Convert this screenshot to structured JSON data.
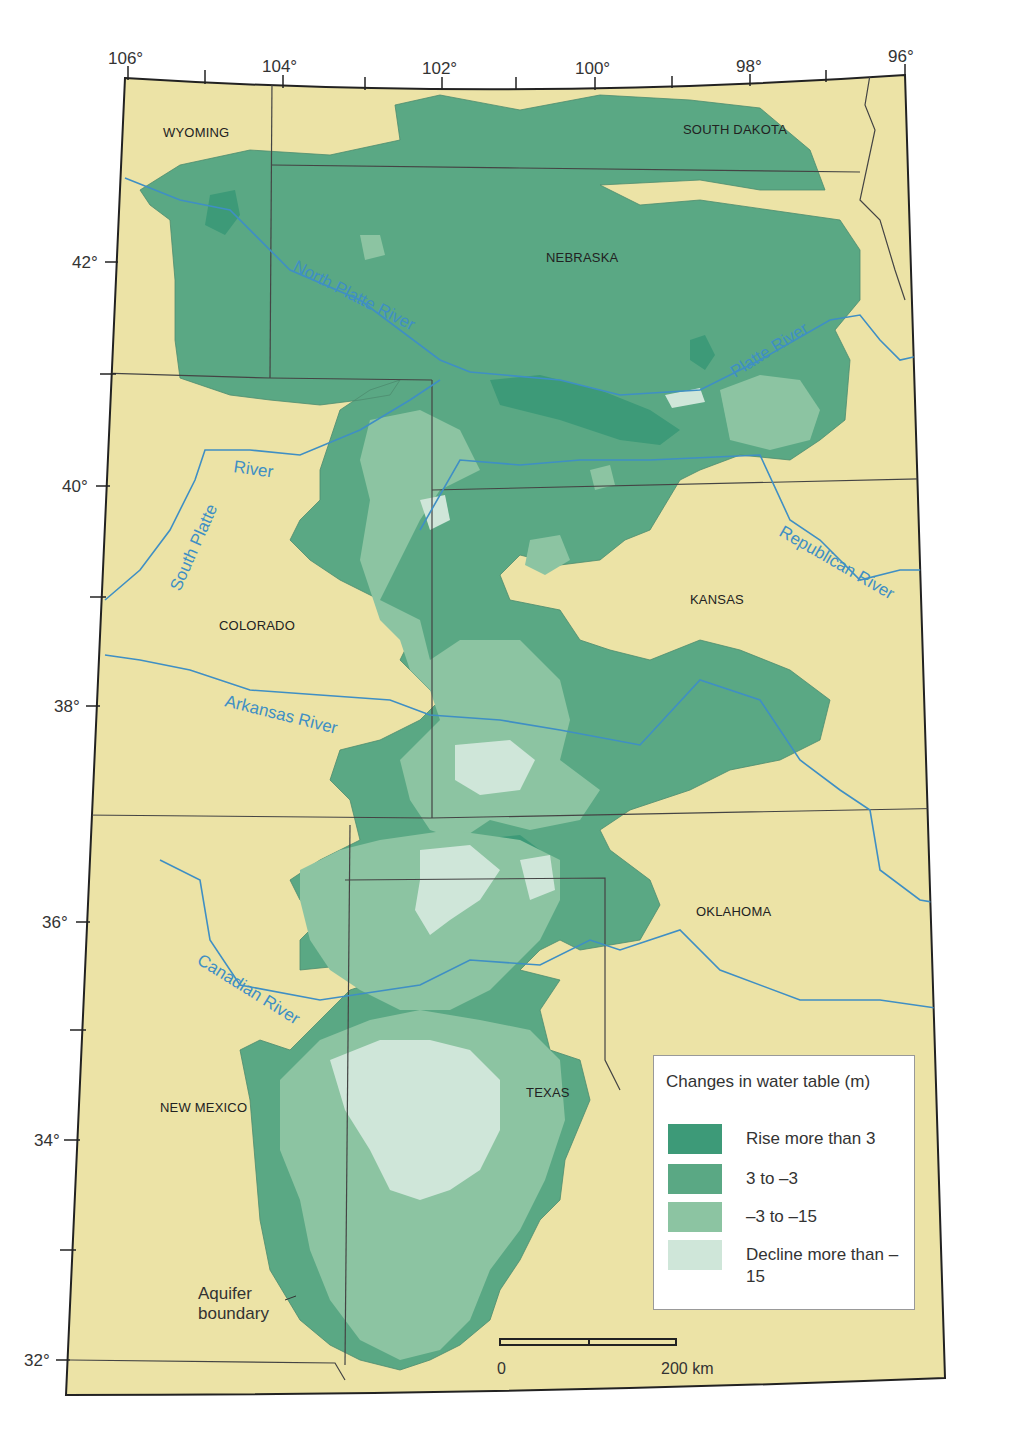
{
  "map": {
    "background_colors": {
      "land": "#ece3a6",
      "outside": "#ffffff",
      "river": "#3f8fc4",
      "border": "#333333"
    },
    "longitude_labels": [
      "106°",
      "104°",
      "102°",
      "100°",
      "98°",
      "96°"
    ],
    "latitude_labels": [
      "42°",
      "40°",
      "38°",
      "36°",
      "34°",
      "32°"
    ],
    "states": {
      "wyoming": "WYOMING",
      "south_dakota": "SOUTH DAKOTA",
      "nebraska": "NEBRASKA",
      "kansas": "KANSAS",
      "colorado": "COLORADO",
      "oklahoma": "OKLAHOMA",
      "new_mexico": "NEW MEXICO",
      "texas": "TEXAS"
    },
    "rivers": {
      "north_platte": "North Platte River",
      "platte": "Platte River",
      "south_platte_1": "South Platte",
      "south_platte_2": "River",
      "republican": "Republican River",
      "arkansas": "Arkansas River",
      "canadian": "Canadian River"
    },
    "aquifer_label_line1": "Aquifer",
    "aquifer_label_line2": "boundary"
  },
  "legend": {
    "title": "Changes in water table (m)",
    "items": [
      {
        "label": "Rise more than 3",
        "color": "#3d9a78"
      },
      {
        "label": "3 to –3",
        "color": "#5aa884"
      },
      {
        "label": "–3 to –15",
        "color": "#8cc4a2"
      },
      {
        "label": "Decline more than –15",
        "color": "#cfe6d9"
      }
    ]
  },
  "scale": {
    "start": "0",
    "end": "200 km"
  }
}
